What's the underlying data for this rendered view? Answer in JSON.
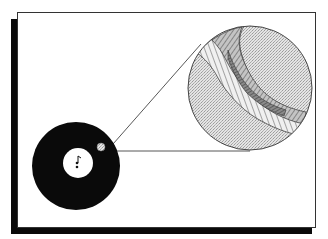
{
  "diagram": {
    "title": "Record groove magnified",
    "colors": {
      "background": "#ffffff",
      "frame_border": "#333333",
      "shadow": "#0a0a0a",
      "record": "#0a0a0a",
      "label": "#ffffff",
      "magnifier_fill": "#d9d9d9",
      "groove_fill": "#b0b0b0",
      "groove_lines": "#444444"
    },
    "elements": {
      "record_icon": "vinyl-record",
      "label_glyph": "♪",
      "highlight_spot": "magnified-region-marker",
      "magnifier": "zoom-circle",
      "groove": "spiral-groove-closeup"
    }
  }
}
